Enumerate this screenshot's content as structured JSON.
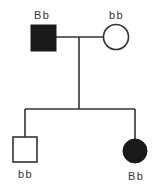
{
  "diagram": {
    "type": "pedigree",
    "colors": {
      "line": "#333333",
      "affected_fill": "#1a1a1a",
      "unaffected_fill": "#ffffff"
    },
    "generation_1": {
      "father": {
        "shape": "square",
        "affected": true,
        "genotype": "Bb"
      },
      "mother": {
        "shape": "circle",
        "affected": false,
        "genotype": "bb"
      }
    },
    "generation_2": {
      "son": {
        "shape": "square",
        "affected": false,
        "genotype": "bb"
      },
      "daughter": {
        "shape": "circle",
        "affected": true,
        "genotype": "Bb"
      }
    }
  }
}
